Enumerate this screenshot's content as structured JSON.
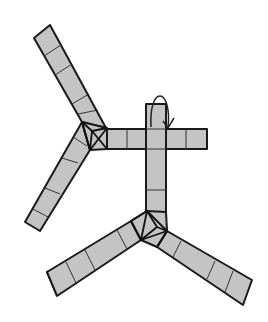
{
  "figure": {
    "colors": {
      "fill": "#c4c4c4",
      "stroke": "#1a1a1a",
      "background": "#ffffff"
    },
    "components": [
      {
        "name": "upper-hub",
        "type": "pyramid-junction",
        "arms": [
          "upper-left-arm",
          "middle-left-arm",
          "horizontal-bar"
        ]
      },
      {
        "name": "lower-hub",
        "type": "pyramid-junction",
        "arms": [
          "vertical-bar",
          "lower-left-arm",
          "lower-right-arm"
        ]
      },
      {
        "name": "cross-strip",
        "type": "cross",
        "parts": [
          "horizontal-bar",
          "vertical-bar"
        ]
      },
      {
        "name": "fold-arrow",
        "type": "curved-arrow",
        "meaning": "fold the top flap over"
      }
    ],
    "arm_segments": {
      "upper-left-arm": 5,
      "middle-left-arm": 4,
      "horizontal-bar": 4,
      "vertical-bar": 5,
      "lower-left-arm": 5,
      "lower-right-arm": 5
    }
  }
}
